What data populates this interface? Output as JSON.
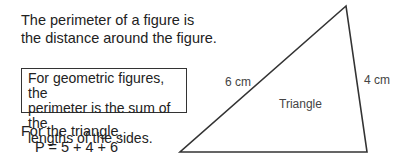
{
  "intro": {
    "line1": "The perimeter of a figure is",
    "line2": "the distance around the figure."
  },
  "definition_box": {
    "line1": "For geometric figures, the",
    "line2": "perimeter is the sum of the",
    "line3": "lengths of the sides."
  },
  "example": {
    "line1": "For the triangle,",
    "formula": "P = 5 + 4 + 6"
  },
  "figure": {
    "name": "Triangle",
    "side_left": "6 cm",
    "side_right": "4 cm"
  }
}
